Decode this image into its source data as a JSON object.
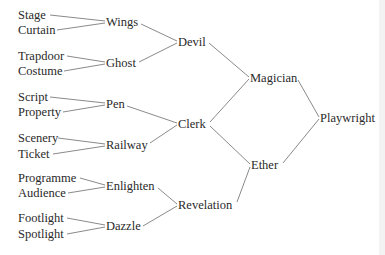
{
  "diagram": {
    "type": "tree",
    "nodes": [
      {
        "id": "stage",
        "label": "Stage",
        "x": 18,
        "y": 15
      },
      {
        "id": "curtain",
        "label": "Curtain",
        "x": 18,
        "y": 30
      },
      {
        "id": "trapdoor",
        "label": "Trapdoor",
        "x": 18,
        "y": 56
      },
      {
        "id": "costume",
        "label": "Costume",
        "x": 18,
        "y": 71
      },
      {
        "id": "script",
        "label": "Script",
        "x": 18,
        "y": 97
      },
      {
        "id": "property",
        "label": "Property",
        "x": 18,
        "y": 112
      },
      {
        "id": "scenery",
        "label": "Scenery",
        "x": 18,
        "y": 138
      },
      {
        "id": "ticket",
        "label": "Ticket",
        "x": 18,
        "y": 154
      },
      {
        "id": "programme",
        "label": "Programme",
        "x": 18,
        "y": 178
      },
      {
        "id": "audience",
        "label": "Audience",
        "x": 18,
        "y": 193
      },
      {
        "id": "footlight",
        "label": "Footlight",
        "x": 18,
        "y": 218
      },
      {
        "id": "spotlight",
        "label": "Spotlight",
        "x": 18,
        "y": 234
      },
      {
        "id": "wings",
        "label": "Wings",
        "x": 106,
        "y": 22
      },
      {
        "id": "ghost",
        "label": "Ghost",
        "x": 106,
        "y": 63
      },
      {
        "id": "pen",
        "label": "Pen",
        "x": 106,
        "y": 104
      },
      {
        "id": "railway",
        "label": "Railway",
        "x": 106,
        "y": 145
      },
      {
        "id": "enlighten",
        "label": "Enlighten",
        "x": 106,
        "y": 186
      },
      {
        "id": "dazzle",
        "label": "Dazzle",
        "x": 106,
        "y": 226
      },
      {
        "id": "devil",
        "label": "Devil",
        "x": 178,
        "y": 42
      },
      {
        "id": "clerk",
        "label": "Clerk",
        "x": 178,
        "y": 124
      },
      {
        "id": "revelation",
        "label": "Revelation",
        "x": 178,
        "y": 205
      },
      {
        "id": "magician",
        "label": "Magician",
        "x": 250,
        "y": 78
      },
      {
        "id": "ether",
        "label": "Ether",
        "x": 251,
        "y": 165
      },
      {
        "id": "playwright",
        "label": "Playwright",
        "x": 320,
        "y": 118
      }
    ],
    "edges": [
      {
        "from": "stage",
        "to": "wings",
        "x1": 50,
        "y1": 15,
        "x2": 105,
        "y2": 21
      },
      {
        "from": "curtain",
        "to": "wings",
        "x1": 57,
        "y1": 30,
        "x2": 105,
        "y2": 23
      },
      {
        "from": "trapdoor",
        "to": "ghost",
        "x1": 67,
        "y1": 56,
        "x2": 105,
        "y2": 62
      },
      {
        "from": "costume",
        "to": "ghost",
        "x1": 64,
        "y1": 71,
        "x2": 105,
        "y2": 64
      },
      {
        "from": "script",
        "to": "pen",
        "x1": 50,
        "y1": 97,
        "x2": 105,
        "y2": 103
      },
      {
        "from": "property",
        "to": "pen",
        "x1": 63,
        "y1": 112,
        "x2": 105,
        "y2": 105
      },
      {
        "from": "scenery",
        "to": "railway",
        "x1": 58,
        "y1": 138,
        "x2": 105,
        "y2": 144
      },
      {
        "from": "ticket",
        "to": "railway",
        "x1": 53,
        "y1": 154,
        "x2": 105,
        "y2": 146
      },
      {
        "from": "programme",
        "to": "enlighten",
        "x1": 80,
        "y1": 178,
        "x2": 105,
        "y2": 185
      },
      {
        "from": "audience",
        "to": "enlighten",
        "x1": 68,
        "y1": 193,
        "x2": 105,
        "y2": 187
      },
      {
        "from": "footlight",
        "to": "dazzle",
        "x1": 67,
        "y1": 218,
        "x2": 105,
        "y2": 225
      },
      {
        "from": "spotlight",
        "to": "dazzle",
        "x1": 67,
        "y1": 234,
        "x2": 105,
        "y2": 227
      },
      {
        "from": "wings",
        "to": "devil",
        "x1": 141,
        "y1": 24,
        "x2": 177,
        "y2": 41
      },
      {
        "from": "ghost",
        "to": "devil",
        "x1": 139,
        "y1": 62,
        "x2": 177,
        "y2": 43
      },
      {
        "from": "pen",
        "to": "clerk",
        "x1": 127,
        "y1": 106,
        "x2": 177,
        "y2": 123
      },
      {
        "from": "railway",
        "to": "clerk",
        "x1": 150,
        "y1": 143,
        "x2": 177,
        "y2": 125
      },
      {
        "from": "enlighten",
        "to": "revelation",
        "x1": 158,
        "y1": 188,
        "x2": 177,
        "y2": 204
      },
      {
        "from": "dazzle",
        "to": "revelation",
        "x1": 143,
        "y1": 226,
        "x2": 177,
        "y2": 206
      },
      {
        "from": "devil",
        "to": "magician",
        "x1": 209,
        "y1": 43,
        "x2": 249,
        "y2": 77
      },
      {
        "from": "clerk",
        "to": "magician",
        "x1": 210,
        "y1": 122,
        "x2": 249,
        "y2": 79
      },
      {
        "from": "clerk",
        "to": "ether",
        "x1": 210,
        "y1": 126,
        "x2": 250,
        "y2": 164
      },
      {
        "from": "revelation",
        "to": "ether",
        "x1": 237,
        "y1": 202,
        "x2": 250,
        "y2": 167
      },
      {
        "from": "magician",
        "to": "playwright",
        "x1": 298,
        "y1": 80,
        "x2": 319,
        "y2": 117
      },
      {
        "from": "ether",
        "to": "playwright",
        "x1": 283,
        "y1": 163,
        "x2": 319,
        "y2": 119
      }
    ]
  }
}
